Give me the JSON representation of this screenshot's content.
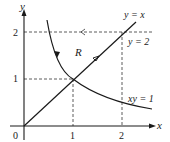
{
  "figure": {
    "type": "region-of-integration-diagram",
    "axes": {
      "x_label": "x",
      "y_label": "y",
      "origin_label": "0",
      "x_ticks": [
        "1",
        "2"
      ],
      "y_ticks": [
        "1",
        "2"
      ]
    },
    "curves": [
      {
        "id": "line-y-eq-x",
        "label": "y = x"
      },
      {
        "id": "line-y-eq-2",
        "label": "y = 2"
      },
      {
        "id": "hyperbola-xy-eq-1",
        "label": "xy = 1"
      }
    ],
    "region_label": "R",
    "colors": {
      "ink": "#1a1a1a",
      "background": "#ffffff"
    }
  }
}
